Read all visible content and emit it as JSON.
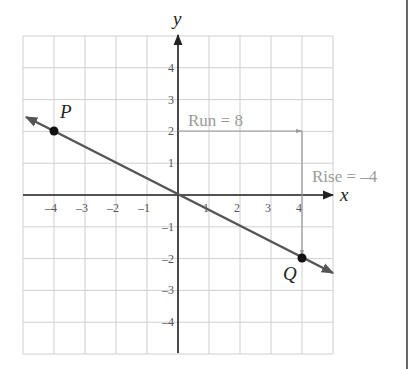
{
  "chart_data": {
    "type": "line",
    "title": "",
    "xlabel": "x",
    "ylabel": "y",
    "xlim": [
      -5,
      5
    ],
    "ylim": [
      -5,
      5
    ],
    "grid": true,
    "x_ticks": [
      -4,
      -3,
      -2,
      -1,
      1,
      2,
      3,
      4
    ],
    "y_ticks": [
      4,
      3,
      2,
      1,
      -1,
      -2,
      -3,
      -4
    ],
    "x_tick_labels": [
      "–4",
      "–3",
      "–2",
      "–1",
      "1",
      "2",
      "3",
      "4"
    ],
    "y_tick_labels": [
      "4",
      "3",
      "2",
      "1",
      "–1",
      "–2",
      "–3",
      "–4"
    ],
    "series": [
      {
        "name": "line PQ",
        "x": [
          -5,
          5
        ],
        "y": [
          2.5,
          -2.5
        ],
        "color": "#555555"
      }
    ],
    "points": [
      {
        "label": "P",
        "x": -4,
        "y": 2
      },
      {
        "label": "Q",
        "x": 4,
        "y": -2
      }
    ],
    "annotations": [
      {
        "text": "Run = 8",
        "from": [
          -4,
          2
        ],
        "to": [
          4,
          2
        ],
        "color": "#999999"
      },
      {
        "text": "Rise = –4",
        "from": [
          4,
          2
        ],
        "to": [
          4,
          -2
        ],
        "color": "#999999"
      }
    ]
  },
  "labels": {
    "x_axis": "x",
    "y_axis": "y",
    "point_p": "P",
    "point_q": "Q",
    "run": "Run = 8",
    "rise": "Rise = –4"
  }
}
